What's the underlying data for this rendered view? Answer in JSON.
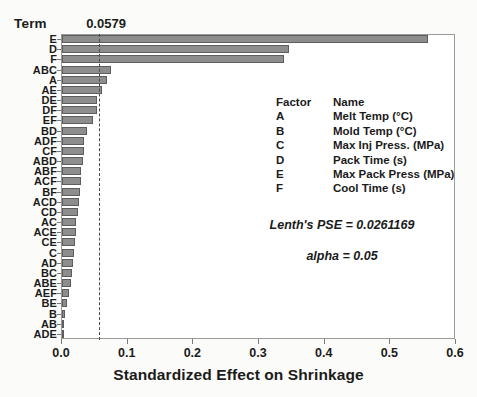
{
  "chart_data": {
    "type": "bar",
    "orientation": "horizontal",
    "title": "",
    "xlabel": "Standardized Effect on Shrinkage",
    "ylabel": "Term",
    "xlim": [
      0.0,
      0.6
    ],
    "xticks": [
      "0.0",
      "0.1",
      "0.2",
      "0.3",
      "0.4",
      "0.5",
      "0.6"
    ],
    "xtick_values": [
      0.0,
      0.1,
      0.2,
      0.3,
      0.4,
      0.5,
      0.6
    ],
    "grid": false,
    "legend_position": "inside-right",
    "reference_line": {
      "label": "0.0579",
      "value": 0.0579,
      "style": "dashed"
    },
    "categories": [
      "E",
      "D",
      "F",
      "ABC",
      "A",
      "AE",
      "DE",
      "DF",
      "EF",
      "BD",
      "ADF",
      "CF",
      "ABD",
      "ABF",
      "ACF",
      "BF",
      "ACD",
      "CD",
      "AC",
      "ACE",
      "CE",
      "C",
      "AD",
      "BC",
      "ABE",
      "AEF",
      "BE",
      "B",
      "AB",
      "ADE"
    ],
    "values": [
      0.558,
      0.345,
      0.338,
      0.075,
      0.068,
      0.061,
      0.053,
      0.053,
      0.047,
      0.038,
      0.033,
      0.033,
      0.032,
      0.029,
      0.029,
      0.028,
      0.026,
      0.024,
      0.022,
      0.021,
      0.02,
      0.018,
      0.016,
      0.015,
      0.013,
      0.011,
      0.008,
      0.005,
      0.003,
      0.0
    ]
  },
  "header": {
    "term_label": "Term"
  },
  "legend": {
    "col_factor": "Factor",
    "col_name": "Name",
    "rows": [
      {
        "factor": "A",
        "name": "Melt Temp (°C)"
      },
      {
        "factor": "B",
        "name": "Mold Temp (°C)"
      },
      {
        "factor": "C",
        "name": "Max Inj Press. (MPa)"
      },
      {
        "factor": "D",
        "name": "Pack Time (s)"
      },
      {
        "factor": "E",
        "name": "Max Pack Press (MPa)"
      },
      {
        "factor": "F",
        "name": "Cool Time (s)"
      }
    ]
  },
  "annotations": {
    "pse": "Lenth's PSE = 0.0261169",
    "alpha": "alpha = 0.05"
  },
  "colors": {
    "bar_fill": "#8d8d8d",
    "bar_border": "#5d5d5d",
    "plot_border": "#9a9a9a",
    "reference_line": "#4a4a4a",
    "background": "#fbfbf9"
  }
}
